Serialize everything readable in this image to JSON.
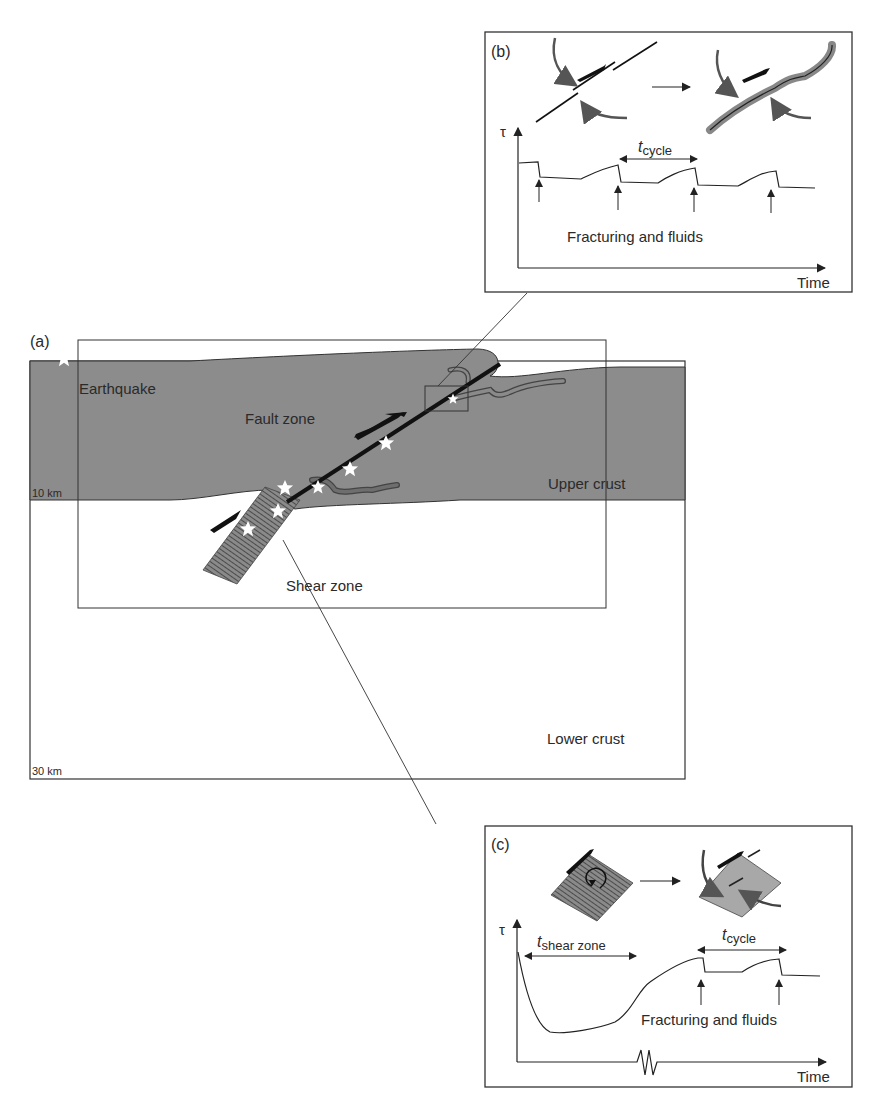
{
  "panel_a": {
    "label": "(a)",
    "legend_earthquake": "Earthquake",
    "fault_zone": "Fault zone",
    "upper_crust": "Upper crust",
    "shear_zone": "Shear zone",
    "lower_crust": "Lower crust",
    "depth_10": "10 km",
    "depth_30": "30 km",
    "colors": {
      "upper_crust_fill": "#8c8c8c",
      "fault": "#111111",
      "star": "#ffffff",
      "vein": "#6e6e6e"
    }
  },
  "panel_b": {
    "label": "(b)",
    "y_axis": "τ",
    "x_axis": "Time",
    "cycle_label_t": "t",
    "cycle_label_sub": "cycle",
    "annotation": "Fracturing and fluids"
  },
  "panel_c": {
    "label": "(c)",
    "y_axis": "τ",
    "x_axis": "Time",
    "shear_label_t": "t",
    "shear_label_sub": "shear zone",
    "cycle_label_t": "t",
    "cycle_label_sub": "cycle",
    "annotation": "Fracturing and fluids"
  }
}
